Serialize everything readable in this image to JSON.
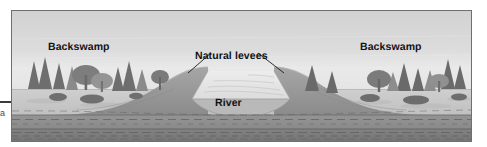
{
  "figure": {
    "title_visible": false,
    "type": "geological-cross-section",
    "frame": {
      "border_color": "#6f6f6f",
      "background": "#d9d9d9"
    }
  },
  "margin": {
    "rule_mark": "",
    "clipped_glyph": "a"
  },
  "labels": {
    "backswamp_left": "Backswamp",
    "backswamp_right": "Backswamp",
    "natural_levees": "Natural levees",
    "river": "River"
  },
  "palette": {
    "sky": "#dcdcdc",
    "sky_low": "#e6e6e6",
    "floodplain_surface": "#c9c9c9",
    "levee_fill": "#9a9a9a",
    "levee_shadow": "#8a8a8a",
    "river_water": "#e2e2e2",
    "channel_floor": "#b4b4b4",
    "substrate_upper": "#8f8f8f",
    "substrate_lower": "#7c7c7c",
    "bedding_line": "#5e5e5e",
    "tree_dark": "#6a6a6a",
    "tree_mid": "#868686",
    "tree_light": "#a2a2a2",
    "text": "#121212"
  },
  "scene": {
    "horizon_y": 88,
    "layers": [
      {
        "name": "sky",
        "description": "pale gray sky with faint horizontal banding"
      },
      {
        "name": "backswamp-plain-left",
        "description": "flat low-lying wooded swamp surface, left third"
      },
      {
        "name": "natural-levee-left",
        "description": "broad low ridge rising toward the channel"
      },
      {
        "name": "river-channel",
        "description": "trapezoidal water surface with faint flow lines"
      },
      {
        "name": "natural-levee-right",
        "description": "broad low ridge descending away from channel"
      },
      {
        "name": "backswamp-plain-right",
        "description": "flat low-lying wooded swamp surface, right third"
      },
      {
        "name": "alluvium-substrate",
        "description": "stacked horizontal dashed bedding layers beneath surface"
      }
    ],
    "vegetation": {
      "left_cluster_count": 9,
      "right_cluster_count": 10,
      "forms": [
        "conifer-spire",
        "broadleaf-round",
        "shrub-clump"
      ]
    },
    "leader_lines": [
      {
        "from": "natural_levees",
        "to": "levee-crest-left"
      },
      {
        "from": "natural_levees",
        "to": "levee-crest-right"
      }
    ]
  }
}
